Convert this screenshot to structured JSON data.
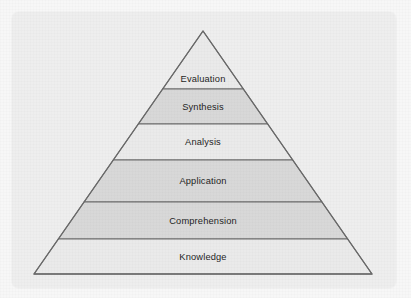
{
  "figure": {
    "name": "blooms-taxonomy-pyramid",
    "shape": "pyramid",
    "tier_count": 6,
    "background_color": "#f7f7f7",
    "panel_color": "#eeeeee",
    "stroke_color": "#6a6a6a",
    "divider_color": "#6a6a6a",
    "label_color": "#1f1f1f",
    "fill_light": "#eaeaea",
    "fill_dark": "#d8d8d8"
  },
  "chart_data": {
    "type": "pyramid",
    "title": "",
    "subtitle": "",
    "xlabel": "",
    "ylabel": "",
    "legend": [],
    "grid": false,
    "orientation": "apex-up",
    "geometry": {
      "apex": [
        203,
        31
      ],
      "base_left": [
        34,
        274
      ],
      "base_right": [
        372,
        274
      ],
      "divider_y": [
        89,
        124,
        160,
        202,
        239
      ]
    },
    "categories": [
      "Evaluation",
      "Synthesis",
      "Analysis",
      "Application",
      "Comprehension",
      "Knowledge"
    ],
    "values": [
      1,
      2,
      3,
      4,
      5,
      6
    ],
    "tiers": [
      {
        "label": "Evaluation",
        "level": 6,
        "top_y": 31,
        "bottom_y": 89,
        "fill": "#eaeaea",
        "shaded": false
      },
      {
        "label": "Synthesis",
        "level": 5,
        "top_y": 89,
        "bottom_y": 124,
        "fill": "#d8d8d8",
        "shaded": true
      },
      {
        "label": "Analysis",
        "level": 4,
        "top_y": 124,
        "bottom_y": 160,
        "fill": "#eaeaea",
        "shaded": false
      },
      {
        "label": "Application",
        "level": 3,
        "top_y": 160,
        "bottom_y": 202,
        "fill": "#d8d8d8",
        "shaded": true
      },
      {
        "label": "Comprehension",
        "level": 2,
        "top_y": 202,
        "bottom_y": 239,
        "fill": "#d8d8d8",
        "shaded": true
      },
      {
        "label": "Knowledge",
        "level": 1,
        "top_y": 239,
        "bottom_y": 274,
        "fill": "#eaeaea",
        "shaded": false
      }
    ]
  }
}
